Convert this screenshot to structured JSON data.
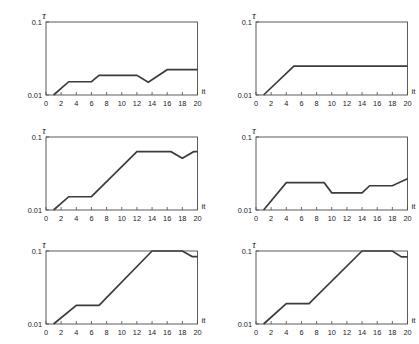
{
  "figure": {
    "rows": 3,
    "cols": 2,
    "background": "#ffffff",
    "line_color": "#3c3c3c",
    "axis_color": "#4a4a4a"
  },
  "axes_common": {
    "xlabel": "it",
    "ylabel": "τ",
    "xticks": [
      0,
      2,
      4,
      6,
      8,
      10,
      12,
      14,
      16,
      18,
      20
    ],
    "xticklabels": [
      "0",
      "2",
      "4",
      "6",
      "8",
      "10",
      "12",
      "14",
      "16",
      "18",
      "20"
    ],
    "yticks": [
      0.01,
      0.1
    ],
    "yticklabels": [
      "0.01",
      "0.1"
    ],
    "xlim": [
      0,
      20
    ],
    "ylim": [
      0.01,
      0.1
    ],
    "yscale": "log",
    "grid": false,
    "legend": "none"
  },
  "chart_data": [
    {
      "type": "line",
      "panel": 1,
      "position": "top-left",
      "title": "",
      "xlabel": "it",
      "ylabel": "τ",
      "xlim": [
        0,
        20
      ],
      "ylim": [
        0.01,
        0.1
      ],
      "yscale": "log",
      "grid": false,
      "x": [
        1,
        3,
        6,
        7,
        12,
        13.5,
        16,
        20
      ],
      "y": [
        0.01,
        0.0152,
        0.0152,
        0.0186,
        0.0186,
        0.015,
        0.0222,
        0.0222
      ]
    },
    {
      "type": "line",
      "panel": 2,
      "position": "top-right",
      "title": "",
      "xlabel": "it",
      "ylabel": "τ",
      "xlim": [
        0,
        20
      ],
      "ylim": [
        0.01,
        0.1
      ],
      "yscale": "log",
      "grid": false,
      "x": [
        1,
        5,
        20
      ],
      "y": [
        0.01,
        0.0248,
        0.0248
      ]
    },
    {
      "type": "line",
      "panel": 3,
      "position": "middle-left",
      "title": "",
      "xlabel": "it",
      "ylabel": "τ",
      "xlim": [
        0,
        20
      ],
      "ylim": [
        0.01,
        0.1
      ],
      "yscale": "log",
      "grid": false,
      "x": [
        1,
        3,
        6,
        12,
        16.5,
        18,
        19.5,
        20
      ],
      "y": [
        0.01,
        0.0152,
        0.0152,
        0.063,
        0.063,
        0.051,
        0.063,
        0.063
      ]
    },
    {
      "type": "line",
      "panel": 4,
      "position": "middle-right",
      "title": "",
      "xlabel": "it",
      "ylabel": "τ",
      "xlim": [
        0,
        20
      ],
      "ylim": [
        0.01,
        0.1
      ],
      "yscale": "log",
      "grid": false,
      "x": [
        1,
        4,
        9,
        10,
        14,
        15,
        18,
        20
      ],
      "y": [
        0.01,
        0.0237,
        0.0237,
        0.0172,
        0.0172,
        0.0215,
        0.0215,
        0.0268
      ]
    },
    {
      "type": "line",
      "panel": 5,
      "position": "bottom-left",
      "title": "",
      "xlabel": "it",
      "ylabel": "τ",
      "xlim": [
        0,
        20
      ],
      "ylim": [
        0.01,
        0.1
      ],
      "yscale": "log",
      "grid": false,
      "x": [
        1,
        4,
        7,
        14,
        18,
        19.3,
        20
      ],
      "y": [
        0.01,
        0.018,
        0.018,
        0.1,
        0.1,
        0.084,
        0.084
      ]
    },
    {
      "type": "line",
      "panel": 6,
      "position": "bottom-right",
      "title": "",
      "xlabel": "it",
      "ylabel": "τ",
      "xlim": [
        0,
        20
      ],
      "ylim": [
        0.01,
        0.1
      ],
      "yscale": "log",
      "grid": false,
      "x": [
        1,
        4,
        7,
        14,
        18,
        19.2,
        20
      ],
      "y": [
        0.01,
        0.019,
        0.019,
        0.1,
        0.1,
        0.083,
        0.083
      ]
    }
  ]
}
